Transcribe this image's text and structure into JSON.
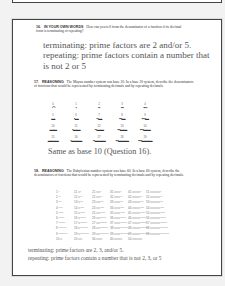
{
  "questions": [
    {
      "number": "16.",
      "tag": "IN YOUR OWN WORDS",
      "text": "How can you tell from the denominator of a fraction if its decimal form is terminating or repeating?",
      "answer": "terminating: prime factors are 2 and/or 5. repeating: prime factors contain a number that is not 2 or 5"
    },
    {
      "number": "17.",
      "tag": "REASONING",
      "text": "The Mayan number system was base 20. In a base 20 system, describe the denominators of fractions that would be represented by terminating decimals and by repeating decimals.",
      "answer": "Same as base 10 (Question 16).",
      "maya_numerals": [
        [
          {
            "n": "0",
            "g": "◠"
          },
          {
            "n": "1",
            "g": "•"
          },
          {
            "n": "2",
            "g": "••"
          },
          {
            "n": "3",
            "g": "•••"
          },
          {
            "n": "4",
            "g": "••••"
          }
        ],
        [
          {
            "n": "5",
            "g": "▬"
          },
          {
            "n": "6",
            "g": "•▬"
          },
          {
            "n": "7",
            "g": "••▬"
          },
          {
            "n": "8",
            "g": "•••▬"
          },
          {
            "n": "9",
            "g": "••••▬"
          }
        ],
        [
          {
            "n": "10",
            "g": "▬▬"
          },
          {
            "n": "11",
            "g": "•▬▬"
          },
          {
            "n": "12",
            "g": "••▬▬"
          },
          {
            "n": "13",
            "g": "•••▬▬"
          },
          {
            "n": "14",
            "g": "••••▬▬"
          }
        ],
        [
          {
            "n": "15",
            "g": "▬▬▬"
          },
          {
            "n": "16",
            "g": "•▬▬▬"
          },
          {
            "n": "17",
            "g": "••▬▬▬"
          },
          {
            "n": "18",
            "g": "•••▬▬▬"
          },
          {
            "n": "19",
            "g": "••••▬▬▬"
          }
        ]
      ]
    },
    {
      "number": "18.",
      "tag": "REASONING",
      "text": "The Babylonian number system was base 60. In a base 60 system, describe the denominators of fractions that would be represented by terminating decimals and by repeating decimals.",
      "answer_line1": "terminating: prime factors are 2, 3, and/or 5.",
      "answer_line2": "repeating: prime factors contain a number that is not 2, 3, or 5",
      "babylonian_numerals": [
        [
          "1 ᵛ",
          "11 ᐸᵛ",
          "21 ᐸᐸᵛ",
          "31 ᐸᐸᐸᵛ",
          "41 ᐸᐸᐸᐸᵛ",
          "51 ᐸᐸᐸᐸᐸᵛ"
        ],
        [
          "2 ᵛᵛ",
          "12 ᐸᵛᵛ",
          "22 ᐸᐸᵛᵛ",
          "32 ᐸᐸᐸᵛᵛ",
          "42 ᐸᐸᐸᐸᵛᵛ",
          "52 ᐸᐸᐸᐸᐸᵛᵛ"
        ],
        [
          "3 ᵛᵛᵛ",
          "13 ᐸᵛᵛᵛ",
          "23 ᐸᐸᵛᵛᵛ",
          "33 ᐸᐸᐸᵛᵛᵛ",
          "43 ᐸᐸᐸᐸᵛᵛᵛ",
          "53 ᐸᐸᐸᐸᐸᵛᵛᵛ"
        ],
        [
          "4 ᵛᵛᵛᵛ",
          "14 ᐸᵛᵛᵛᵛ",
          "24 ᐸᐸᵛᵛᵛᵛ",
          "34 ᐸᐸᐸᵛᵛᵛᵛ",
          "44 ᐸᐸᐸᐸᵛᵛᵛᵛ",
          "54 ᐸᐸᐸᐸᐸᵛᵛᵛᵛ"
        ],
        [
          "5 ᵛᵛᵛᵛᵛ",
          "15 ᐸᵛᵛᵛᵛᵛ",
          "25 ᐸᐸᵛᵛᵛᵛᵛ",
          "35 ᐸᐸᐸᵛᵛᵛᵛᵛ",
          "45 ᐸᐸᐸᐸᵛᵛᵛᵛᵛ",
          "55 ᐸᐸᐸᐸᐸᵛᵛᵛᵛᵛ"
        ],
        [
          "6 ᵛᵛᵛᵛᵛᵛ",
          "16 ᐸᵛᵛᵛᵛᵛᵛ",
          "26 ᐸᐸᵛᵛᵛᵛᵛᵛ",
          "36 ᐸᐸᐸᵛᵛᵛᵛᵛᵛ",
          "46 ᐸᐸᐸᐸᵛᵛᵛᵛᵛᵛ",
          "56 ᐸᐸᐸᐸᐸᵛᵛᵛᵛᵛᵛ"
        ],
        [
          "7 ᵛᵛᵛᵛᵛᵛᵛ",
          "17 ᐸᵛᵛᵛᵛᵛᵛᵛ",
          "27 ᐸᐸᵛᵛᵛᵛᵛᵛᵛ",
          "37 ᐸᐸᐸᵛᵛᵛᵛᵛᵛᵛ",
          "47 ᐸᐸᐸᐸᵛᵛᵛᵛᵛᵛᵛ",
          "57 ᐸᐸᐸᐸᐸᵛᵛᵛᵛᵛᵛᵛ"
        ],
        [
          "8 ᵛᵛᵛᵛᵛᵛᵛᵛ",
          "18 ᐸᵛᵛᵛᵛᵛᵛᵛᵛ",
          "28 ᐸᐸᵛᵛᵛᵛᵛᵛᵛᵛ",
          "38 ᐸᐸᐸᵛᵛᵛᵛᵛᵛᵛᵛ",
          "48 ᐸᐸᐸᐸᵛᵛᵛᵛᵛᵛᵛᵛ",
          "58 ᐸᐸᐸᐸᐸᵛᵛᵛᵛᵛᵛᵛᵛ"
        ],
        [
          "9 ᵛᵛᵛᵛᵛᵛᵛᵛᵛ",
          "19 ᐸᵛᵛᵛᵛᵛᵛᵛᵛᵛ",
          "29 ᐸᐸᵛᵛᵛᵛᵛᵛᵛᵛᵛ",
          "39 ᐸᐸᐸᵛᵛᵛᵛᵛᵛᵛᵛᵛ",
          "49 ᐸᐸᐸᐸᵛᵛᵛᵛᵛᵛᵛᵛᵛ",
          "59 ᐸᐸᐸᐸᐸᵛᵛᵛᵛᵛᵛᵛᵛᵛ"
        ],
        [
          "10 ᐸ",
          "20 ᐸᐸ",
          "30 ᐸᐸᐸ",
          "40 ᐸᐸᐸᐸ",
          "50 ᐸᐸᐸᐸᐸ",
          ""
        ]
      ]
    }
  ]
}
